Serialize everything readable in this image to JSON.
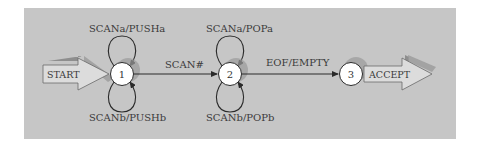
{
  "diagram": {
    "type": "state-machine",
    "colors": {
      "panel": "#c6c6c6",
      "state_fill": "#ffffff",
      "edge": "#2a2a2a",
      "shadow": "#9a9a9a",
      "arrow_fill": "#d9d9d9"
    },
    "entry": {
      "label": "START"
    },
    "exit": {
      "label": "ACCEPT"
    },
    "states": [
      {
        "id": "1",
        "label": "1"
      },
      {
        "id": "2",
        "label": "2"
      },
      {
        "id": "3",
        "label": "3"
      }
    ],
    "transitions": [
      {
        "from": "1",
        "to": "1",
        "label": "SCANa/PUSHa",
        "position": "top"
      },
      {
        "from": "1",
        "to": "1",
        "label": "SCANb/PUSHb",
        "position": "bottom"
      },
      {
        "from": "1",
        "to": "2",
        "label": "SCAN#"
      },
      {
        "from": "2",
        "to": "2",
        "label": "SCANa/POPa",
        "position": "top"
      },
      {
        "from": "2",
        "to": "2",
        "label": "SCANb/POPb",
        "position": "bottom"
      },
      {
        "from": "2",
        "to": "3",
        "label": "EOF/EMPTY"
      }
    ]
  }
}
